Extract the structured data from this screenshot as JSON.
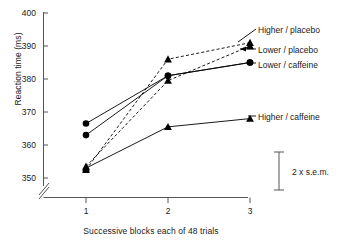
{
  "chart_data": {
    "type": "line",
    "title": "",
    "xlabel": "Successive blocks each of 48 trials",
    "ylabel": "Reaction time (ms)",
    "x": [
      1,
      2,
      3
    ],
    "xticklabels": [
      "1",
      "2",
      "3"
    ],
    "yticklabels": [
      "350",
      "360",
      "370",
      "380",
      "390",
      "400"
    ],
    "yticks": [
      350,
      360,
      370,
      380,
      390,
      400
    ],
    "ylim": [
      347,
      400
    ],
    "xlim": [
      0.55,
      3.35
    ],
    "axis_break": true,
    "grid": false,
    "legend_position": "right-inline",
    "series": [
      {
        "name": "Higher / placebo",
        "values": [
          352.5,
          386.0,
          391.0
        ],
        "marker": "triangle",
        "line": "dashed",
        "color": "#000000"
      },
      {
        "name": "Lower / placebo",
        "values": [
          353.5,
          379.5,
          390.0
        ],
        "marker": "triangle",
        "line": "dashed",
        "color": "#000000"
      },
      {
        "name": "Lower / caffeine",
        "values": [
          363.0,
          381.0,
          385.0
        ],
        "marker": "circle",
        "line": "solid",
        "color": "#000000"
      },
      {
        "name": "Higher / caffeine",
        "values": [
          353.0,
          365.5,
          368.0
        ],
        "marker": "triangle",
        "line": "solid",
        "color": "#000000"
      },
      {
        "name": "Lower / caffeine (upper block 1 point)",
        "values": [
          366.5,
          381.0,
          385.0
        ],
        "marker": "circle",
        "line": "solid",
        "color": "#000000"
      }
    ],
    "annotations": [
      {
        "text": "2 x s.e.m.",
        "type": "error-bar-scale",
        "span_ms": 9.0
      }
    ]
  },
  "legend": {
    "items": [
      {
        "label": "Higher / placebo"
      },
      {
        "label": "Lower / placebo"
      },
      {
        "label": "Lower / caffeine"
      },
      {
        "label": "Higher / caffeine"
      }
    ]
  },
  "axes": {
    "y_ticks": [
      "400",
      "390",
      "380",
      "370",
      "360",
      "350"
    ],
    "x_ticks": [
      "1",
      "2",
      "3"
    ],
    "y_title": "Reaction time (ms)",
    "x_title": "Successive blocks each of 48 trials"
  },
  "error_bar": {
    "label": "2 x s.e.m."
  },
  "colors": {
    "ink": "#000000",
    "axis": "#555555",
    "background": "#ffffff"
  }
}
